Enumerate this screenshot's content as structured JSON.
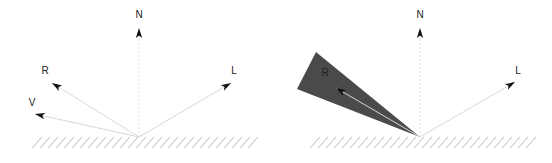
{
  "figure": {
    "panels": [
      {
        "id": "left",
        "description": "Phong reflection vectors on a surface",
        "origin": [
          139,
          137
        ],
        "vectors": [
          {
            "name": "N",
            "label": "N",
            "tip": [
              139,
              28
            ],
            "label_pos": [
              139,
              18
            ]
          },
          {
            "name": "R",
            "label": "R",
            "tip": [
              52,
              83
            ],
            "label_pos": [
              45,
              74
            ]
          },
          {
            "name": "V",
            "label": "V",
            "tip": [
              35,
              114
            ],
            "label_pos": [
              32,
              106
            ]
          },
          {
            "name": "L",
            "label": "L",
            "tip": [
              231,
              83
            ],
            "label_pos": [
              234,
              74
            ]
          }
        ],
        "ground": {
          "x1": 32,
          "x2": 248,
          "y": 137
        }
      },
      {
        "id": "right",
        "description": "Glossy reflection lobe around R",
        "origin": [
          420,
          137
        ],
        "lobe": {
          "points": [
            [
              420,
              137
            ],
            [
              316,
              52
            ],
            [
              297,
              89
            ]
          ],
          "color": "#4a4a4a"
        },
        "vectors": [
          {
            "name": "N",
            "label": "N",
            "tip": [
              420,
              28
            ],
            "label_pos": [
              420,
              18
            ]
          },
          {
            "name": "R",
            "label": "R",
            "tip": [
              336,
              88
            ],
            "label_pos": [
              325,
              76
            ]
          },
          {
            "name": "L",
            "label": "L",
            "tip": [
              515,
              82
            ],
            "label_pos": [
              518,
              74
            ]
          }
        ],
        "ground": {
          "x1": 310,
          "x2": 530,
          "y": 137
        }
      }
    ]
  },
  "colors": {
    "vector_line": "#d8d8d8",
    "normal_line": "#e0e0e0",
    "arrowhead": "#111111",
    "hatch": "#bdbdbd",
    "lobe": "#4a4a4a",
    "label": "#222222"
  }
}
